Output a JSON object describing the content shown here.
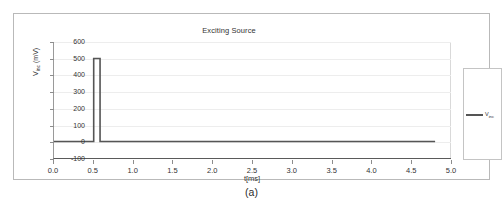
{
  "figure": {
    "caption": "(a)"
  },
  "legend": {
    "series_label_main": "V",
    "series_label_sub": "inc"
  },
  "axis": {
    "y_label_main": "V",
    "y_label_sub": "inc",
    "y_label_unit": " (mV)",
    "x_label": "t[ms]"
  },
  "colors": {
    "trace": "#555555",
    "frame": "#b9b9b9",
    "grid": "#ededed",
    "axis": "#8d8d8d",
    "text": "#333333"
  },
  "chart_data": {
    "type": "line",
    "title": "Exciting Source",
    "xlabel": "t[ms]",
    "ylabel": "Vinc (mV)",
    "xlim": [
      0.0,
      5.0
    ],
    "ylim": [
      -100,
      600
    ],
    "grid": true,
    "legend_position": "right",
    "xticks": [
      "0.0",
      "0.5",
      "1.0",
      "1.5",
      "2.0",
      "2.5",
      "3.0",
      "3.5",
      "4.0",
      "4.5",
      "5.0"
    ],
    "xtick_values": [
      0.0,
      0.5,
      1.0,
      1.5,
      2.0,
      2.5,
      3.0,
      3.5,
      4.0,
      4.5,
      5.0
    ],
    "yticks": [
      "-100",
      "0",
      "100",
      "200",
      "300",
      "400",
      "500",
      "600"
    ],
    "ytick_values": [
      -100,
      0,
      100,
      200,
      300,
      400,
      500,
      600
    ],
    "series": [
      {
        "name": "Vinc",
        "x": [
          0.0,
          0.5,
          0.5,
          0.58,
          0.58,
          4.8
        ],
        "y": [
          0,
          0,
          500,
          500,
          0,
          0
        ],
        "description": "Single rectangular excitation pulse of 500 mV amplitude, starting at t = 0.5 ms with a width of about 0.08 ms; baseline 0 mV elsewhere up to t = 4.8 ms."
      }
    ]
  }
}
